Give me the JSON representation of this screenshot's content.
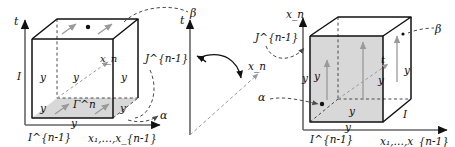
{
  "figure": {
    "type": "mathematical-diagram",
    "background_color": "#ffffff",
    "ink_color": "#111111",
    "shade_color": "#d8d8d8",
    "arrow_gray": "#9a9a9a",
    "dash_color": "#4a4a4a"
  },
  "left_cube": {
    "name": "left-cube",
    "vertical_axis_label": "t",
    "horizontal_axis_label": "x₁,…,x_{n-1}",
    "diagonal_axis_label": "x_n",
    "left_edge_label": "I",
    "bottom_left_label": "I^{n-1}",
    "side_label": "J^{n-1}",
    "shaded_face_label": "Γ^n",
    "curve_label_top": "β",
    "curve_label_bottom": "α",
    "face_labels": [
      "y",
      "y",
      "y"
    ],
    "edge_labels": [
      "y",
      "y",
      "y"
    ],
    "shaded_face": "bottom",
    "arrow_direction": "up-right",
    "dot_location": "top-face-center"
  },
  "middle": {
    "name": "rotation-indicator",
    "vertical_axis_label": "t",
    "diagonal_axis_label": "x_n",
    "rotation_arrow": "curved-clockwise"
  },
  "right_cube": {
    "name": "right-cube",
    "vertical_axis_label": "x_n",
    "horizontal_axis_label": "x₁,…,x_{n-1}",
    "diagonal_axis_label": "t",
    "right_edge_label": "I",
    "bottom_left_label": "I^{n-1}",
    "side_label": "J^{n-1}",
    "curve_label_top": "β",
    "curve_label_bottom": "α",
    "face_labels": [
      "y",
      "y",
      "y"
    ],
    "edge_labels": [
      "y",
      "y",
      "y"
    ],
    "shaded_face": "front",
    "arrow_direction": "up",
    "dot_location": "front-face-lower-left"
  }
}
